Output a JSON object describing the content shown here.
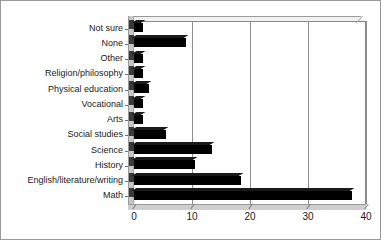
{
  "chart_data": {
    "type": "bar",
    "orientation": "horizontal",
    "title": "",
    "subtitle": "",
    "xlabel": "",
    "ylabel": "",
    "xlim": [
      0,
      40
    ],
    "ylim": null,
    "grid": true,
    "legend": false,
    "legend_position": "none",
    "xticks": [
      0,
      10,
      20,
      30,
      40
    ],
    "xtick_labels": [
      "0",
      "10",
      "20",
      "30",
      "40"
    ],
    "bar_color": "#000000",
    "plot_background": "#ffffff",
    "wall_color": "#c8c8c8",
    "categories": [
      "Not sure",
      "None",
      "Other",
      "Religion/philosophy",
      "Physical education",
      "Vocational",
      "Arts",
      "Social studies",
      "Science",
      "History",
      "English/literature/writing",
      "Math"
    ],
    "values": [
      1.5,
      9,
      1.5,
      1.5,
      2.5,
      1.5,
      1.5,
      5.5,
      13.5,
      10.5,
      18.5,
      37.5
    ],
    "series": [
      {
        "name": "",
        "values": [
          1.5,
          9,
          1.5,
          1.5,
          2.5,
          1.5,
          1.5,
          5.5,
          13.5,
          10.5,
          18.5,
          37.5
        ]
      }
    ],
    "annotations": []
  }
}
